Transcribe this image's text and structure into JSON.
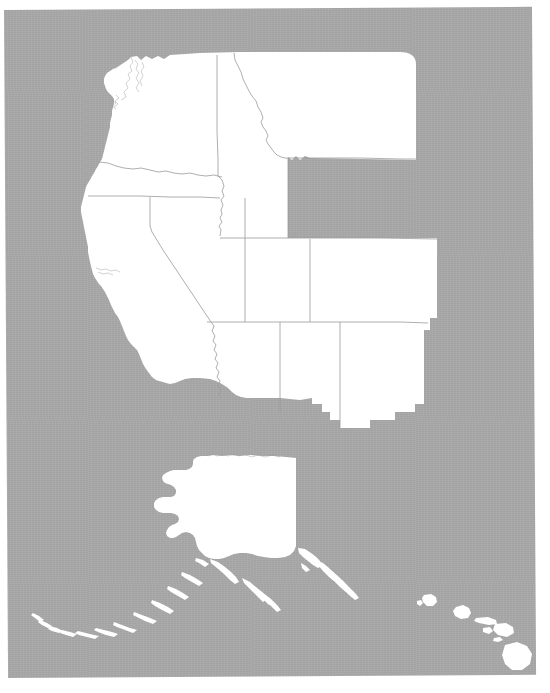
{
  "document": {
    "kind": "outline-map",
    "title": "Western United States Outline Map",
    "description": "Photocopied blank outline map showing the western contiguous United States with state boundaries, plus Alaska and the Hawaiian Islands.",
    "paper_background_color": "#a6a6a6",
    "land_fill_color": "#ffffff",
    "border_line_color": "#9a9a9a",
    "page_background_color": "#ffffff",
    "labels_present": "none"
  },
  "map": {
    "projection_note": "Alaska and Hawaii shown as insets below the contiguous states",
    "regions": [
      {
        "name": "Contiguous Western States",
        "id": "conus-west",
        "states": [
          {
            "id": "WA",
            "name": "Washington"
          },
          {
            "id": "OR",
            "name": "Oregon"
          },
          {
            "id": "ID",
            "name": "Idaho"
          },
          {
            "id": "MT",
            "name": "Montana"
          },
          {
            "id": "WY",
            "name": "Wyoming"
          },
          {
            "id": "CA",
            "name": "California"
          },
          {
            "id": "NV",
            "name": "Nevada"
          },
          {
            "id": "UT",
            "name": "Utah"
          },
          {
            "id": "CO",
            "name": "Colorado"
          },
          {
            "id": "AZ",
            "name": "Arizona"
          },
          {
            "id": "NM",
            "name": "New Mexico"
          }
        ]
      },
      {
        "name": "Alaska",
        "id": "alaska",
        "states": [
          {
            "id": "AK",
            "name": "Alaska"
          }
        ],
        "features": [
          {
            "id": "aleutian-islands",
            "name": "Aleutian Islands"
          },
          {
            "id": "alexander-archipelago",
            "name": "Alexander Archipelago"
          }
        ]
      },
      {
        "name": "Hawaii",
        "id": "hawaii",
        "states": [
          {
            "id": "HI",
            "name": "Hawaii"
          }
        ],
        "features": [
          {
            "id": "kauai",
            "name": "Kauai"
          },
          {
            "id": "oahu",
            "name": "Oahu"
          },
          {
            "id": "molokai",
            "name": "Molokai"
          },
          {
            "id": "lanai",
            "name": "Lanai"
          },
          {
            "id": "maui",
            "name": "Maui"
          },
          {
            "id": "hawaii-island",
            "name": "Hawaii"
          }
        ]
      }
    ]
  }
}
